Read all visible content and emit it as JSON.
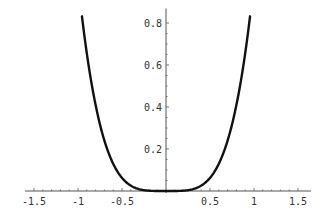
{
  "chart_data": {
    "type": "line",
    "title": "",
    "xlabel": "",
    "ylabel": "",
    "function": "y = x^4",
    "xlim": [
      -1.5,
      1.5
    ],
    "ylim": [
      0,
      0.85
    ],
    "grid": false,
    "legend": null,
    "x_ticks": [
      -1.5,
      -1,
      -0.5,
      0.5,
      1,
      1.5
    ],
    "x_tick_labels": [
      "-1.5",
      "-1",
      "-0.5",
      "0.5",
      "1",
      "1.5"
    ],
    "y_ticks": [
      0.2,
      0.4,
      0.6,
      0.8
    ],
    "y_tick_labels": [
      "0.2",
      "0.4",
      "0.6",
      "0.8"
    ],
    "series": [
      {
        "name": "x^4",
        "color": "#111111",
        "x": [
          -0.955,
          -0.9,
          -0.8,
          -0.7,
          -0.6,
          -0.5,
          -0.4,
          -0.3,
          -0.2,
          -0.1,
          0,
          0.1,
          0.2,
          0.3,
          0.4,
          0.5,
          0.6,
          0.7,
          0.8,
          0.9,
          0.955
        ],
        "y": [
          0.832,
          0.656,
          0.41,
          0.24,
          0.13,
          0.0625,
          0.0256,
          0.0081,
          0.0016,
          0.0001,
          0,
          0.0001,
          0.0016,
          0.0081,
          0.0256,
          0.0625,
          0.13,
          0.24,
          0.41,
          0.656,
          0.832
        ]
      }
    ]
  },
  "layout": {
    "origin_px": [
      166,
      191
    ],
    "x_px_per_unit": 88,
    "y_px_per_unit": 210,
    "axis_color": "#555555"
  }
}
